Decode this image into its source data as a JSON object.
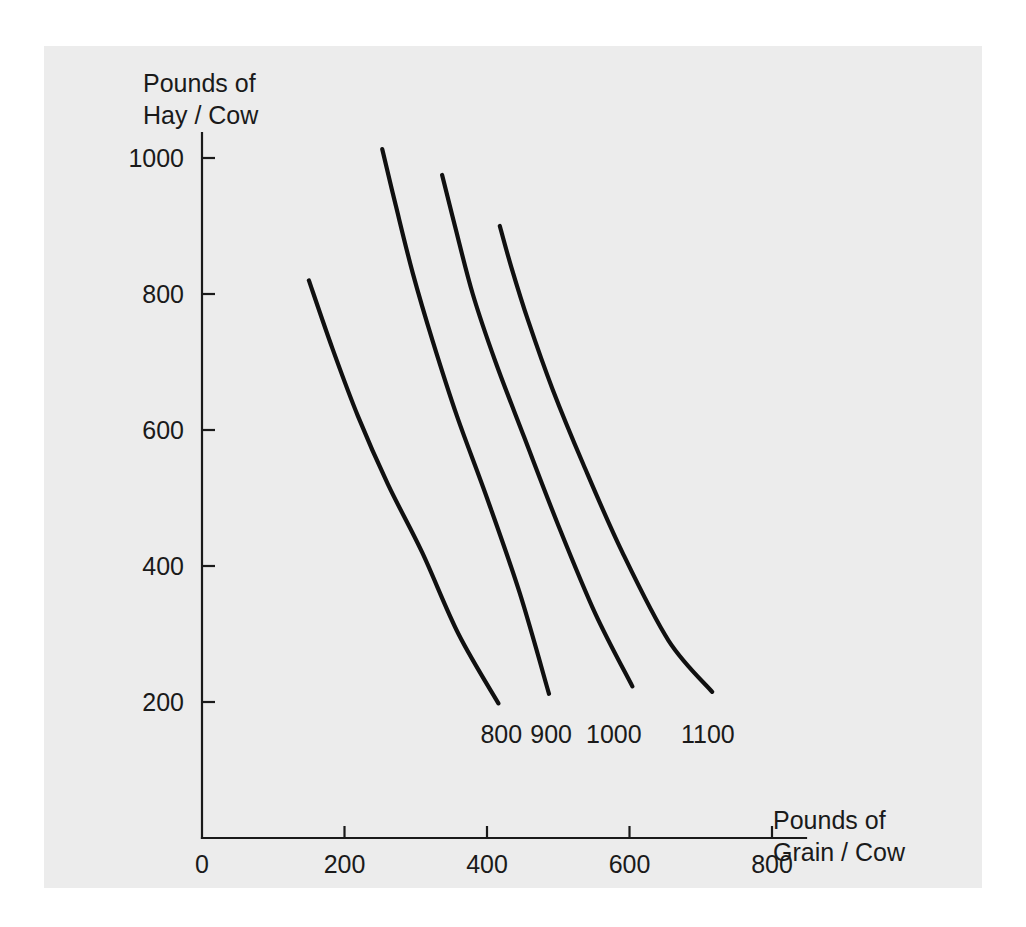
{
  "figure": {
    "background_color": "#ffffff",
    "panel_color": "#ececec",
    "ink_color": "#101010"
  },
  "chart_data": {
    "type": "line",
    "title": "",
    "subtitle": "",
    "xlabel_line1": "Pounds of",
    "xlabel_line2": "Grain / Cow",
    "ylabel_line1": "Pounds of",
    "ylabel_line2": "Hay / Cow",
    "xlim": [
      0,
      850
    ],
    "ylim": [
      0,
      1060
    ],
    "xticks": [
      0,
      200,
      400,
      600,
      800
    ],
    "xtick_labels": [
      "0",
      "200",
      "400",
      "600",
      "800"
    ],
    "yticks": [
      200,
      400,
      600,
      800,
      1000
    ],
    "ytick_labels": [
      "200",
      "400",
      "600",
      "800",
      "1000"
    ],
    "grid": false,
    "legend_position": "inline-end-labels",
    "annotations": [
      "800",
      "900",
      "1000",
      "1100"
    ],
    "series": [
      {
        "name": "800",
        "label": "800",
        "label_x": 420,
        "label_y": 140,
        "x": [
          150,
          183,
          219,
          261,
          309,
          360,
          416
        ],
        "y": [
          820,
          720,
          620,
          520,
          420,
          300,
          198
        ]
      },
      {
        "name": "900",
        "label": "900",
        "label_x": 490,
        "label_y": 140,
        "x": [
          253,
          272,
          296,
          324,
          358,
          400,
          446,
          487
        ],
        "y": [
          1013,
          930,
          830,
          730,
          620,
          500,
          360,
          212
        ]
      },
      {
        "name": "1000",
        "label": "1000",
        "label_x": 578,
        "label_y": 140,
        "x": [
          337,
          355,
          380,
          412,
          452,
          500,
          552,
          604
        ],
        "y": [
          975,
          900,
          800,
          700,
          590,
          460,
          330,
          223
        ]
      },
      {
        "name": "1100",
        "label": "1100",
        "label_x": 710,
        "label_y": 140,
        "x": [
          418,
          434,
          458,
          492,
          535,
          590,
          655,
          716
        ],
        "y": [
          900,
          840,
          760,
          660,
          550,
          420,
          290,
          215
        ]
      }
    ]
  }
}
